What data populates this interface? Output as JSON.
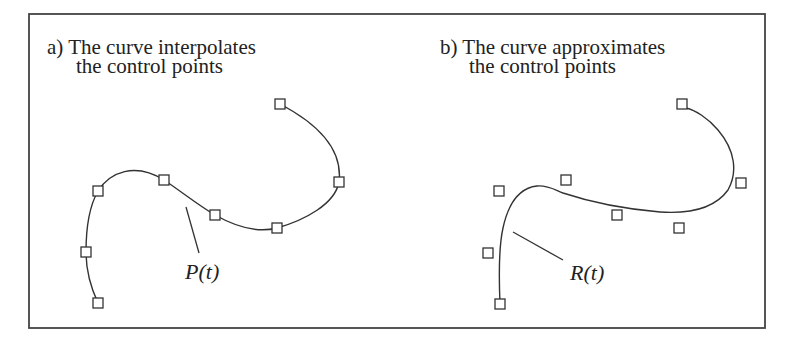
{
  "figure": {
    "panel_a": {
      "title_line1": "a) The curve interpolates",
      "title_line2": "the control points",
      "curve_label_main": "P",
      "curve_label_open": "(",
      "curve_label_var": "t",
      "curve_label_close": ")",
      "curve_label_full": "P(t)",
      "control_points": [
        [
          98,
          303
        ],
        [
          86,
          252
        ],
        [
          98,
          191
        ],
        [
          164,
          180
        ],
        [
          215,
          215
        ],
        [
          277,
          228
        ],
        [
          339,
          182
        ],
        [
          280,
          104
        ]
      ]
    },
    "panel_b": {
      "title_line1": "b) The curve approximates",
      "title_line2": "the control points",
      "curve_label_main": "R",
      "curve_label_open": "(",
      "curve_label_var": "t",
      "curve_label_close": ")",
      "curve_label_full": "R(t)",
      "control_points": [
        [
          500,
          304
        ],
        [
          488,
          253
        ],
        [
          499,
          191
        ],
        [
          566,
          180
        ],
        [
          617,
          215
        ],
        [
          679,
          228
        ],
        [
          741,
          183
        ],
        [
          682,
          104
        ]
      ]
    },
    "colors": {
      "line": "#333333",
      "background": "#ffffff"
    }
  }
}
